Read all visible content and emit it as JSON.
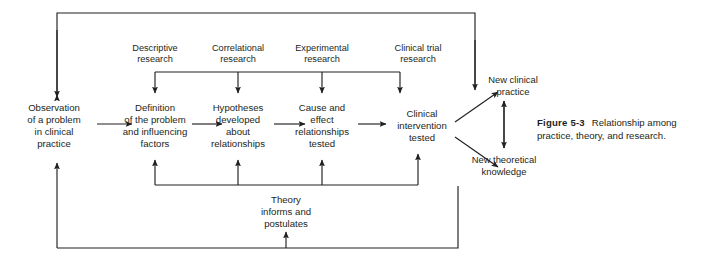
{
  "figure": {
    "caption_label": "Figure 5-3",
    "caption_text": "Relationship among practice, theory, and research."
  },
  "diagram": {
    "title": "Relationship among practice, theory, and research",
    "type": "flow-diagram",
    "source_labels": [
      {
        "id": "descriptive-research",
        "line1": "Descriptive",
        "line2": "research"
      },
      {
        "id": "correlational-research",
        "line1": "Correlational",
        "line2": "research"
      },
      {
        "id": "experimental-research",
        "line1": "Experimental",
        "line2": "research"
      },
      {
        "id": "clinical-trial-research",
        "line1": "Clinical trial",
        "line2": "research"
      }
    ],
    "main_nodes": [
      {
        "id": "observation",
        "lines": [
          "Observation",
          "of a problem",
          "in clinical",
          "practice"
        ]
      },
      {
        "id": "definition",
        "lines": [
          "Definition",
          "of the problem",
          "and influencing",
          "factors"
        ]
      },
      {
        "id": "hypotheses",
        "lines": [
          "Hypotheses",
          "developed",
          "about",
          "relationships"
        ]
      },
      {
        "id": "cause-effect",
        "lines": [
          "Cause and",
          "effect",
          "relationships",
          "tested"
        ]
      },
      {
        "id": "clinical-intervention",
        "lines": [
          "Clinical",
          "intervention",
          "tested"
        ]
      }
    ],
    "outcome_nodes": [
      {
        "id": "new-clinical-practice",
        "lines": [
          "New clinical",
          "practice"
        ]
      },
      {
        "id": "new-theoretical-knowledge",
        "lines": [
          "New theoretical",
          "knowledge"
        ]
      }
    ],
    "theory_node": {
      "id": "theory",
      "lines": [
        "Theory",
        "informs and",
        "postulates"
      ]
    },
    "colors": {
      "ink": "#231f20",
      "background": "#ffffff"
    }
  }
}
